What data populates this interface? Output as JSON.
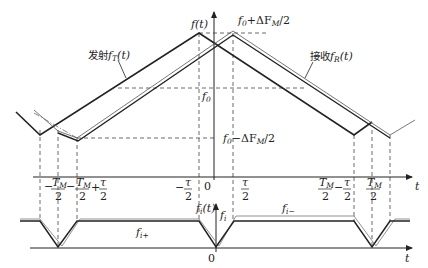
{
  "diagram": {
    "upper_plot": {
      "y_axis_label": "f(t)",
      "x_axis_label": "t",
      "transmit_label_cn": "发射",
      "transmit_label_sym": "f",
      "transmit_label_sub": "T",
      "transmit_label_arg": "(t)",
      "receive_label_cn": "接收",
      "receive_label_sym": "f",
      "receive_label_sub": "R",
      "receive_label_arg": "(t)",
      "level_top": "f0+ΔFM/2",
      "level_top_parts": {
        "f": "f",
        "sub0": "0",
        "mid": "+ΔF",
        "subM": "M",
        "tail": "/2"
      },
      "level_mid": "f0",
      "level_mid_parts": {
        "f": "f",
        "sub0": "0"
      },
      "level_bottom": "f0−ΔFM/2",
      "level_bottom_parts": {
        "f": "f",
        "sub0": "0",
        "mid": "−ΔF",
        "subM": "M",
        "tail": "/2"
      },
      "origin": "0"
    },
    "time_ticks": [
      {
        "label": "−TM/2",
        "sign": "−",
        "num": "T",
        "num_sub": "M",
        "den": "2"
      },
      {
        "label": "−TM/2+τ/2",
        "sign": "−",
        "num": "T",
        "num_sub": "M",
        "den": "2",
        "plus": "+",
        "num2": "τ",
        "den2": "2"
      },
      {
        "label": "−τ/2",
        "sign": "−",
        "num": "τ",
        "den": "2"
      },
      {
        "label": "0",
        "num": "0"
      },
      {
        "label": "τ/2",
        "num": "τ",
        "den": "2"
      },
      {
        "label": "TM/2−τ/2",
        "num": "T",
        "num_sub": "M",
        "den": "2",
        "minus": "−",
        "num2": "τ",
        "den2": "2"
      },
      {
        "label": "TM/2",
        "num": "T",
        "num_sub": "M",
        "den": "2"
      }
    ],
    "lower_plot": {
      "y_axis_label": "fi(t)",
      "y_axis_sym": "f",
      "y_axis_sub": "i",
      "y_axis_arg": "(t)",
      "level_label_sym": "f",
      "level_label_sub": "i",
      "up_beat_sym": "f",
      "up_beat_sub": "i+",
      "down_beat_sym": "f",
      "down_beat_sub": "i−",
      "x_axis_label": "t",
      "origin": "0"
    },
    "colors": {
      "line": "#222222",
      "dashed": "#444444",
      "receive_outline": "#555555"
    }
  }
}
